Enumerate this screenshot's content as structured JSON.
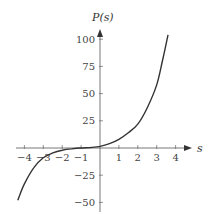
{
  "chart_data": {
    "type": "line",
    "title": "",
    "xlabel": "s",
    "ylabel": "P(s)",
    "xlim": [
      -4.35,
      4.6
    ],
    "ylim": [
      -50,
      110
    ],
    "grid": false,
    "legend": null,
    "x_ticks": [
      -4,
      -3,
      -2,
      -1,
      1,
      2,
      3,
      4
    ],
    "x_tick_labels": [
      "−4",
      "−3",
      "−2",
      "−1",
      "1",
      "2",
      "3",
      "4"
    ],
    "y_ticks": [
      100,
      75,
      50,
      25,
      -25,
      -50
    ],
    "y_tick_labels": [
      "100",
      "75",
      "50",
      "25",
      "−25",
      "−50"
    ],
    "series": [
      {
        "name": "P(s)",
        "color": "#333333",
        "x": [
          -4.35,
          -4,
          -3.5,
          -3,
          -2.5,
          -2,
          -1.5,
          -1,
          -0.5,
          0,
          0.5,
          1,
          1.5,
          2,
          2.5,
          3,
          3.3,
          3.6
        ],
        "values": [
          -48,
          -33,
          -18,
          -9,
          -4.5,
          -2,
          -0.8,
          0,
          0.5,
          1.5,
          4,
          8,
          14,
          22,
          37,
          58,
          80,
          104
        ]
      }
    ]
  }
}
